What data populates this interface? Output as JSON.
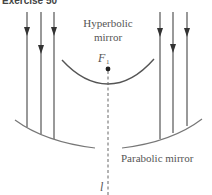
{
  "figure": {
    "title": "Exercise 50",
    "hyperbolic_label_line1": "Hyperbolic",
    "hyperbolic_label_line2": "mirror",
    "focus_label": "F",
    "focus_subscript": "1",
    "parabolic_label": "Parabolic mirror",
    "axis_label": "l",
    "colors": {
      "lines": "#555555",
      "text": "#555555",
      "mirror": "#666666"
    },
    "left_rays": [
      {
        "x": 27,
        "arrow_y": 32
      },
      {
        "x": 41,
        "arrow_y": 50
      },
      {
        "x": 54,
        "arrow_y": 32
      }
    ],
    "right_rays": [
      {
        "x": 160,
        "arrow_y": 33
      },
      {
        "x": 173,
        "arrow_y": 49
      },
      {
        "x": 187,
        "arrow_y": 33
      }
    ]
  }
}
